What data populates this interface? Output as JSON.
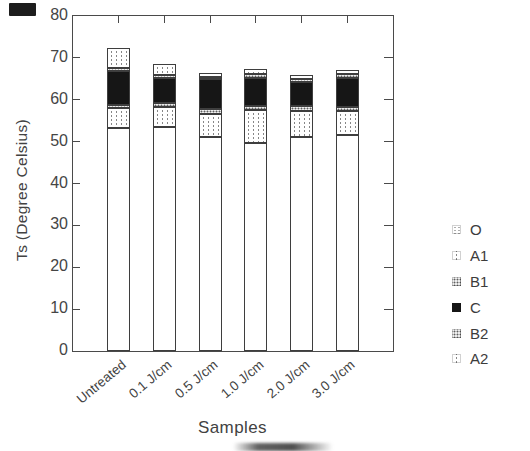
{
  "figure": {
    "background": "#ffffff",
    "ink_color": "#4a4a4a",
    "bar_fill_black": "#161616"
  },
  "chart_data": {
    "type": "bar",
    "stacked": true,
    "title": "",
    "xlabel": "Samples",
    "ylabel": "Ts (Degree Celsius)",
    "ylim": [
      0,
      80
    ],
    "ytick_interval": 10,
    "ytick_labels": [
      "0",
      "10",
      "20",
      "30",
      "40",
      "50",
      "60",
      "70",
      "80"
    ],
    "grid": false,
    "legend_position": "right-outside",
    "categories": [
      "Untreated",
      "0.1 J/cm",
      "0.5 J/cm",
      "1.0 J/cm",
      "2.0 J/cm",
      "3.0 J/cm"
    ],
    "series": [
      {
        "name": "O",
        "pattern": "white-plain",
        "values": [
          53.2,
          53.6,
          51.2,
          49.6,
          51.2,
          51.5
        ]
      },
      {
        "name": "A1",
        "pattern": "light-dotted-columns",
        "values": [
          4.8,
          4.6,
          5.3,
          7.9,
          6.2,
          5.8
        ]
      },
      {
        "name": "B1",
        "pattern": "dense-gray-dots",
        "values": [
          0.8,
          1.1,
          1.2,
          1.0,
          1.0,
          1.0
        ]
      },
      {
        "name": "C",
        "pattern": "solid-black",
        "values": [
          8.0,
          6.0,
          7.2,
          6.8,
          5.9,
          7.0
        ]
      },
      {
        "name": "B2",
        "pattern": "dense-gray-dots",
        "values": [
          0.7,
          0.7,
          0.6,
          0.8,
          0.7,
          0.9
        ]
      },
      {
        "name": "A2",
        "pattern": "light-dotted-columns",
        "values": [
          4.8,
          2.5,
          0.8,
          1.2,
          0.9,
          0.8
        ]
      }
    ],
    "stack_totals": [
      72.3,
      68.5,
      66.3,
      67.3,
      65.9,
      67.0
    ],
    "legend_order": [
      "O",
      "A1",
      "B1",
      "C",
      "B2",
      "A2"
    ]
  }
}
